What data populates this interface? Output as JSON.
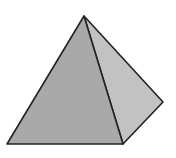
{
  "figure": {
    "shape": "square-pyramid",
    "width": 176,
    "height": 158,
    "background": "#ffffff",
    "stroke_color": "#222222",
    "vertices": {
      "apex": [
        84,
        16
      ],
      "base_front_left": [
        7,
        144
      ],
      "base_front_right": [
        123,
        144
      ],
      "base_back_right": [
        163,
        102
      ]
    },
    "faces": [
      {
        "name": "front-face",
        "fill": "#a9a9a9"
      },
      {
        "name": "side-face",
        "fill": "#c2c2c2"
      }
    ]
  }
}
